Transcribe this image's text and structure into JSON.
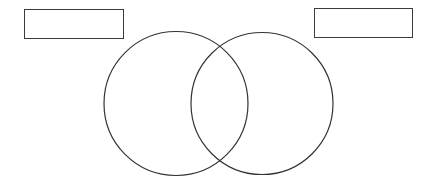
{
  "diagram": {
    "type": "venn",
    "stroke_color": "#333333",
    "background": "#ffffff",
    "labels": {
      "left": "",
      "right": ""
    },
    "circles": [
      {
        "name": "left",
        "cx": 176,
        "cy": 103.5,
        "r": 72
      },
      {
        "name": "right",
        "cx": 262,
        "cy": 103.5,
        "r": 71
      }
    ]
  }
}
